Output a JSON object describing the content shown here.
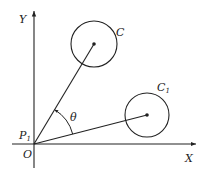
{
  "figure": {
    "axes": {
      "x_label": "X",
      "y_label": "Y",
      "origin_label": "O",
      "point_label": "P",
      "point_subscript": "1"
    },
    "circles": [
      {
        "label": "C",
        "subscript": ""
      },
      {
        "label": "C",
        "subscript": "1"
      }
    ],
    "angle_label": "θ",
    "colors": {
      "stroke": "#222222",
      "background": "#ffffff"
    }
  }
}
